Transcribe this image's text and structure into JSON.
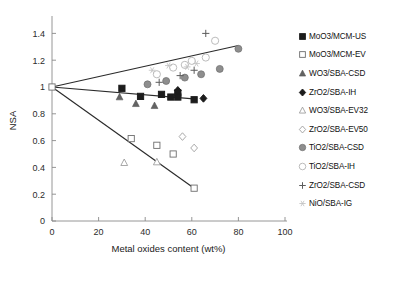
{
  "chart_data": {
    "type": "scatter",
    "title": "",
    "xlabel": "Metal oxides content (wt%)",
    "ylabel": "NSA",
    "xlim": [
      0,
      100
    ],
    "ylim": [
      0,
      1.5
    ],
    "xticks": [
      0,
      20,
      40,
      60,
      80,
      100
    ],
    "yticks": [
      0,
      0.2,
      0.4,
      0.6,
      0.8,
      1,
      1.2,
      1.4
    ],
    "xtick_labels": [
      "0",
      "20",
      "40",
      "60",
      "80",
      "100"
    ],
    "ytick_labels": [
      "0",
      "0.2",
      "0.4",
      "0.6",
      "0.8",
      "1",
      "1.2",
      "1.4"
    ],
    "grid": false,
    "legend_position": "right",
    "trendlines": [
      {
        "name": "upper-trend",
        "x": [
          0,
          80
        ],
        "y": [
          1.0,
          1.31
        ],
        "color": "#2a2a2a"
      },
      {
        "name": "middle-trend",
        "x": [
          0,
          62
        ],
        "y": [
          1.0,
          0.91
        ],
        "color": "#2a2a2a"
      },
      {
        "name": "lower-trend",
        "x": [
          0,
          61
        ],
        "y": [
          1.0,
          0.245
        ],
        "color": "#2a2a2a"
      }
    ],
    "origin_marker": {
      "x": 0,
      "y": 1.0,
      "marker": "open-square"
    },
    "series": [
      {
        "name": "MoO3/MCM-US",
        "marker": "filled-square",
        "color": "#1c1c1c",
        "points": [
          [
            30,
            0.99
          ],
          [
            38,
            0.93
          ],
          [
            47,
            0.945
          ],
          [
            51,
            0.925
          ],
          [
            54,
            0.955
          ],
          [
            54,
            0.925
          ],
          [
            61,
            0.905
          ]
        ]
      },
      {
        "name": "MoO3/MCM-EV",
        "marker": "open-square",
        "color": "#6d6d6d",
        "points": [
          [
            34,
            0.615
          ],
          [
            45,
            0.565
          ],
          [
            52,
            0.5
          ],
          [
            61,
            0.245
          ]
        ]
      },
      {
        "name": "WO3/SBA-CSD",
        "marker": "filled-triangle",
        "color": "#636363",
        "points": [
          [
            29,
            0.925
          ],
          [
            36,
            0.875
          ],
          [
            44,
            0.86
          ]
        ]
      },
      {
        "name": "ZrO2/SBA-IH",
        "marker": "filled-diamond",
        "color": "#1c1c1c",
        "points": [
          [
            54,
            0.975
          ],
          [
            65,
            0.915
          ]
        ]
      },
      {
        "name": "WO3/SBA-EV32",
        "marker": "open-triangle",
        "color": "#9a9a9a",
        "points": [
          [
            31,
            0.435
          ],
          [
            45,
            0.44
          ]
        ]
      },
      {
        "name": "ZrO2/SBA-EV50",
        "marker": "open-diamond",
        "color": "#9a9a9a",
        "points": [
          [
            56,
            0.63
          ],
          [
            61,
            0.545
          ]
        ]
      },
      {
        "name": "TiO2/SBA-CSD",
        "marker": "filled-circle",
        "color": "#8e8e8e",
        "points": [
          [
            41,
            1.02
          ],
          [
            49,
            1.045
          ],
          [
            57,
            1.07
          ],
          [
            64,
            1.095
          ],
          [
            72,
            1.135
          ],
          [
            80,
            1.285
          ]
        ]
      },
      {
        "name": "TiO2/SBA-IH",
        "marker": "open-circle",
        "color": "#b4b4b4",
        "points": [
          [
            45,
            1.095
          ],
          [
            52,
            1.145
          ],
          [
            57,
            1.165
          ],
          [
            60,
            1.195
          ],
          [
            66,
            1.22
          ],
          [
            70,
            1.345
          ]
        ]
      },
      {
        "name": "ZrO2/SBA-CSD",
        "marker": "plus",
        "color": "#5c5c5c",
        "points": [
          [
            46,
            1.035
          ],
          [
            55,
            1.085
          ],
          [
            61,
            1.125
          ],
          [
            66,
            1.4
          ]
        ]
      },
      {
        "name": "NiO/SBA-IG",
        "marker": "star",
        "color": "#c2c2c2",
        "points": [
          [
            43,
            1.125
          ],
          [
            50,
            1.16
          ],
          [
            58,
            1.15
          ],
          [
            62,
            1.175
          ]
        ]
      }
    ]
  },
  "legend": {
    "items": [
      {
        "label": "MoO3/MCM-US",
        "marker": "filled-square"
      },
      {
        "label": "MoO3/MCM-EV",
        "marker": "open-square"
      },
      {
        "label": "WO3/SBA-CSD",
        "marker": "filled-triangle"
      },
      {
        "label": "ZrO2/SBA-IH",
        "marker": "filled-diamond"
      },
      {
        "label": "WO3/SBA-EV32",
        "marker": "open-triangle"
      },
      {
        "label": "ZrO2/SBA-EV50",
        "marker": "open-diamond"
      },
      {
        "label": "TiO2/SBA-CSD",
        "marker": "filled-circle"
      },
      {
        "label": "TiO2/SBA-IH",
        "marker": "open-circle"
      },
      {
        "label": "ZrO2/SBA-CSD",
        "marker": "plus"
      },
      {
        "label": "NiO/SBA-IG",
        "marker": "star"
      }
    ]
  }
}
